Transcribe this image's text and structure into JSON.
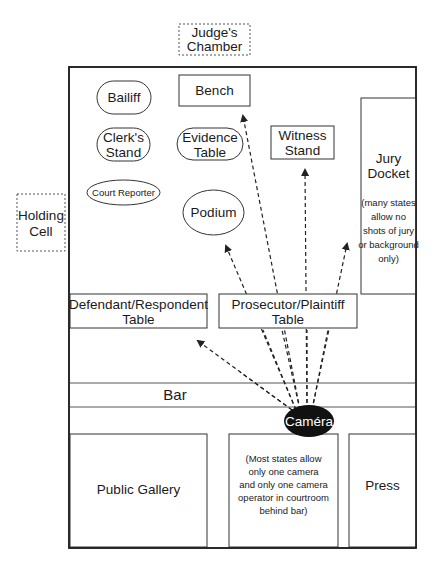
{
  "diagram": {
    "outside_rooms": {
      "judges_chamber": {
        "line1": "Judge's",
        "line2": "Chamber"
      },
      "holding_cell": {
        "line1": "Holding",
        "line2": "Cell"
      }
    },
    "front": {
      "bailiff": "Bailiff",
      "bench": "Bench",
      "clerks_stand": {
        "line1": "Clerk's",
        "line2": "Stand"
      },
      "evidence_table": {
        "line1": "Evidence",
        "line2": "Table"
      },
      "witness_stand": {
        "line1": "Witness",
        "line2": "Stand"
      },
      "court_reporter": "Court Reporter",
      "podium": "Podium",
      "jury_docket": {
        "line1": "Jury",
        "line2": "Docket",
        "note": [
          "(many states",
          "allow no",
          "shots of jury",
          "or background",
          "only)"
        ]
      }
    },
    "tables": {
      "defendant": {
        "line1": "Defendant/Respondent",
        "line2": "Table"
      },
      "prosecutor": {
        "line1": "Prosecutor/Plaintiff",
        "line2": "Table"
      }
    },
    "bar": "Bar",
    "camera": "Caméra",
    "back": {
      "public_gallery": "Public Gallery",
      "camera_note": [
        "(Most states allow",
        "only one camera",
        "and only one camera",
        "operator in courtroom",
        "behind bar)"
      ],
      "press": "Press"
    },
    "camera_sightlines": [
      {
        "target": "Bench",
        "from": [
          300,
          410
        ],
        "to": [
          243,
          116
        ]
      },
      {
        "target": "Witness Stand",
        "from": [
          307,
          410
        ],
        "to": [
          305,
          170
        ]
      },
      {
        "target": "Podium",
        "from": [
          296,
          410
        ],
        "to": [
          226,
          246
        ]
      },
      {
        "target": "Jury Docket",
        "from": [
          312,
          410
        ],
        "to": [
          347,
          244
        ]
      },
      {
        "target": "Defendant/Respondent Table",
        "from": [
          292,
          410
        ],
        "to": [
          198,
          341
        ]
      }
    ]
  }
}
